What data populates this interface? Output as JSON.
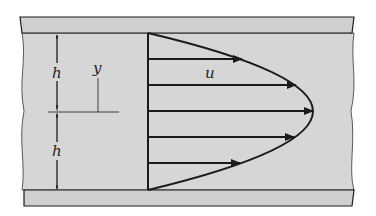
{
  "diagram": {
    "labels": {
      "h_top": "h",
      "h_bottom": "h",
      "y": "y",
      "u": "u"
    },
    "colors": {
      "fluid": "#d6d6d6",
      "plate": "#cfcfcf",
      "line": "#1a1a1a"
    },
    "arrows": [
      {
        "y": 59,
        "x_end": 242
      },
      {
        "y": 85,
        "x_end": 296
      },
      {
        "y": 111,
        "x_end": 313
      },
      {
        "y": 137,
        "x_end": 294
      },
      {
        "y": 163,
        "x_end": 240
      }
    ]
  }
}
